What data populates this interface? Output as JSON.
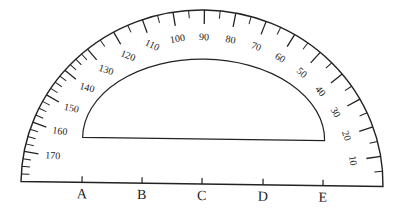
{
  "diagram": {
    "colors": {
      "stroke": "#222222",
      "background": "#ffffff"
    },
    "protractor": {
      "degree_labels": [
        "10",
        "20",
        "30",
        "40",
        "50",
        "60",
        "70",
        "80",
        "90",
        "100",
        "110",
        "120",
        "130",
        "140",
        "150",
        "160",
        "170"
      ],
      "label_start_side": "right"
    },
    "baseline_points": [
      "A",
      "B",
      "C",
      "D",
      "E"
    ]
  }
}
